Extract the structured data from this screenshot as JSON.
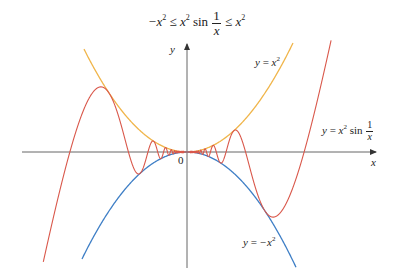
{
  "title": {
    "inequality_left": "−x",
    "exp": "2",
    "leq": "≤",
    "middle_x": "x",
    "sin": "sin",
    "frac_num": "1",
    "frac_den": "x",
    "right_x": "x"
  },
  "axes": {
    "x_label": "x",
    "y_label": "y",
    "origin_label": "0",
    "axis_color": "#555555"
  },
  "curves": [
    {
      "name": "y = x^2",
      "label_y": "y",
      "label_eq": "=",
      "label_x": "x",
      "label_exp": "2",
      "color": "#f0b54a"
    },
    {
      "name": "y = x^2 sin(1/x)",
      "label_y": "y",
      "label_eq": "=",
      "label_x": "x",
      "label_exp": "2",
      "label_sin": "sin",
      "label_num": "1",
      "label_den": "x",
      "color": "#d9574a"
    },
    {
      "name": "y = -x^2",
      "label_y": "y",
      "label_eq": "=",
      "label_neg": "−x",
      "label_exp": "2",
      "color": "#3f7fc6"
    }
  ]
}
